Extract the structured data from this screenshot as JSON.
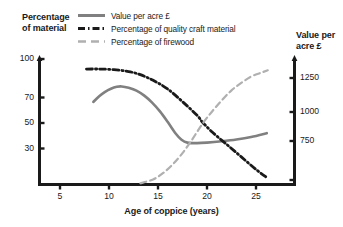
{
  "chart_data": {
    "type": "line",
    "title": "",
    "xlabel": "Age of coppice (years)",
    "ylabel": "Percentage of material",
    "y2label": "Value per acre £",
    "xlim": [
      0,
      27.2
    ],
    "xticks": [
      5,
      10,
      15,
      20,
      25
    ],
    "ylim": [
      0,
      100
    ],
    "yticks": [
      30,
      50,
      70,
      100
    ],
    "y2lim": [
      500,
      1430
    ],
    "y2ticks": [
      750,
      1000,
      1250
    ],
    "grid": false,
    "legend_position": "top",
    "series": [
      {
        "name": "Value per acre £",
        "axis": "right",
        "style": "solid",
        "color": "#808080",
        "x": [
          8.4,
          9,
          9.6,
          10.2,
          10.8,
          11.3,
          12,
          12.8,
          13.6,
          14.4,
          15.2,
          16,
          16.8,
          17.4,
          18,
          19,
          20,
          21.5,
          23,
          24.5,
          26.1
        ],
        "values": [
          1060,
          1105,
          1140,
          1165,
          1180,
          1183,
          1172,
          1150,
          1110,
          1055,
          985,
          900,
          810,
          760,
          737,
          733,
          737,
          748,
          762,
          782,
          812
        ]
      },
      {
        "name": "Percentage of quality craft material",
        "axis": "left",
        "style": "dash-dot",
        "color": "#1a1a1a",
        "x": [
          7.7,
          9,
          10.5,
          12,
          13.2,
          14.5,
          16,
          17.5,
          19,
          19.5,
          20.5,
          22,
          23.5,
          25,
          26.2
        ],
        "values": [
          92,
          92,
          91.5,
          90,
          87.5,
          83,
          76,
          66,
          55,
          50,
          42,
          32,
          22,
          12,
          5
        ]
      },
      {
        "name": "Percentage of firewood",
        "axis": "left",
        "style": "dashed",
        "color": "#b0b0b0",
        "x": [
          13.2,
          14.5,
          15.5,
          16.5,
          17.5,
          18.5,
          19.5,
          20.5,
          21.5,
          22.5,
          23.5,
          24.5,
          25.5,
          26.2
        ],
        "values": [
          1,
          4,
          9,
          16,
          25,
          36,
          48,
          58,
          67,
          75,
          81,
          86,
          89,
          91
        ]
      }
    ]
  },
  "legend": {
    "items": [
      {
        "label": "Value per acre £",
        "style": "solid",
        "color": "#808080"
      },
      {
        "label": "Percentage of quality craft material",
        "style": "dash-dot",
        "color": "#1a1a1a"
      },
      {
        "label": "Percentage of firewood",
        "style": "dashed",
        "color": "#b0b0b0"
      }
    ]
  },
  "axes": {
    "y_left_title": "Percentage\nof material",
    "y_left_title_line1": "Percentage",
    "y_left_title_line2": "of material",
    "y_right_title_line1": "Value per",
    "y_right_title_line2": "acre £",
    "x_title": "Age of coppice (years)",
    "y_left_ticks": [
      "100",
      "70",
      "50",
      "30"
    ],
    "y_right_ticks": [
      "1250",
      "1000",
      "750"
    ],
    "x_ticks": [
      "5",
      "10",
      "15",
      "20",
      "25"
    ]
  }
}
